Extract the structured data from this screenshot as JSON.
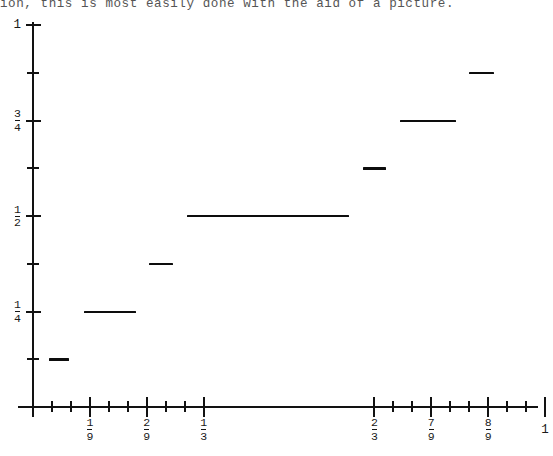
{
  "caption": {
    "text": "ion, this is most easily done with the aid of a picture."
  },
  "chart_data": {
    "type": "line",
    "title": "",
    "subtitle": "",
    "xlabel": "",
    "ylabel": "",
    "xlim": [
      0,
      1
    ],
    "ylim": [
      0,
      1
    ],
    "grid": false,
    "legend": null,
    "x_ticks": [
      {
        "value": 0,
        "label": "",
        "kind": "major",
        "labeled": false
      },
      {
        "value": 0.037,
        "label": "",
        "kind": "minor",
        "labeled": false
      },
      {
        "value": 0.074,
        "label": "",
        "kind": "minor",
        "labeled": false
      },
      {
        "value": 0.1111,
        "label": "1/9",
        "kind": "major",
        "labeled": true,
        "num": "1",
        "den": "9"
      },
      {
        "value": 0.1481,
        "label": "",
        "kind": "minor",
        "labeled": false
      },
      {
        "value": 0.1852,
        "label": "",
        "kind": "minor",
        "labeled": false
      },
      {
        "value": 0.2222,
        "label": "2/9",
        "kind": "major",
        "labeled": true,
        "num": "2",
        "den": "9"
      },
      {
        "value": 0.2593,
        "label": "",
        "kind": "minor",
        "labeled": false
      },
      {
        "value": 0.2963,
        "label": "",
        "kind": "minor",
        "labeled": false
      },
      {
        "value": 0.3333,
        "label": "1/3",
        "kind": "major",
        "labeled": true,
        "num": "1",
        "den": "3"
      },
      {
        "value": 0.6667,
        "label": "2/3",
        "kind": "major",
        "labeled": true,
        "num": "2",
        "den": "3"
      },
      {
        "value": 0.7037,
        "label": "",
        "kind": "minor",
        "labeled": false
      },
      {
        "value": 0.7407,
        "label": "",
        "kind": "minor",
        "labeled": false
      },
      {
        "value": 0.7778,
        "label": "7/9",
        "kind": "major",
        "labeled": true,
        "num": "7",
        "den": "9"
      },
      {
        "value": 0.8148,
        "label": "",
        "kind": "minor",
        "labeled": false
      },
      {
        "value": 0.8519,
        "label": "",
        "kind": "minor",
        "labeled": false
      },
      {
        "value": 0.8889,
        "label": "8/9",
        "kind": "major",
        "labeled": true,
        "num": "8",
        "den": "9"
      },
      {
        "value": 0.9259,
        "label": "",
        "kind": "minor",
        "labeled": false
      },
      {
        "value": 0.963,
        "label": "",
        "kind": "minor",
        "labeled": false
      },
      {
        "value": 1.0,
        "label": "1",
        "kind": "major",
        "labeled": true,
        "whole": "1"
      }
    ],
    "y_ticks": [
      {
        "value": 1.0,
        "label": "1",
        "kind": "major",
        "labeled": true,
        "whole": "1"
      },
      {
        "value": 0.875,
        "label": "",
        "kind": "minor",
        "labeled": false
      },
      {
        "value": 0.75,
        "label": "3/4",
        "kind": "major",
        "labeled": true,
        "num": "3",
        "den": "4"
      },
      {
        "value": 0.625,
        "label": "",
        "kind": "minor",
        "labeled": false
      },
      {
        "value": 0.5,
        "label": "1/2",
        "kind": "major",
        "labeled": true,
        "num": "1",
        "den": "2"
      },
      {
        "value": 0.375,
        "label": "",
        "kind": "minor",
        "labeled": false
      },
      {
        "value": 0.25,
        "label": "1/4",
        "kind": "major",
        "labeled": true,
        "num": "1",
        "den": "4"
      },
      {
        "value": 0.125,
        "label": "",
        "kind": "minor",
        "labeled": false
      },
      {
        "value": 0.0,
        "label": "",
        "kind": "major",
        "labeled": false
      }
    ],
    "segments": [
      {
        "x0": 0.0313,
        "x1": 0.0703,
        "y": 0.125,
        "label": "1/8"
      },
      {
        "x0": 0.0996,
        "x1": 0.2012,
        "y": 0.25,
        "label": "1/4"
      },
      {
        "x0": 0.2266,
        "x1": 0.2734,
        "y": 0.375,
        "label": "3/8"
      },
      {
        "x0": 0.3008,
        "x1": 0.6172,
        "y": 0.5,
        "label": "1/2"
      },
      {
        "x0": 0.6445,
        "x1": 0.6895,
        "y": 0.625,
        "label": "5/8"
      },
      {
        "x0": 0.7168,
        "x1": 0.8262,
        "y": 0.75,
        "label": "3/4"
      },
      {
        "x0": 0.8516,
        "x1": 0.9004,
        "y": 0.875,
        "label": "7/8"
      }
    ]
  },
  "axes_geometry": {
    "origin_x_px": 33,
    "origin_y_px": 407,
    "x_unit_px": 512,
    "y_unit_px": 382
  }
}
